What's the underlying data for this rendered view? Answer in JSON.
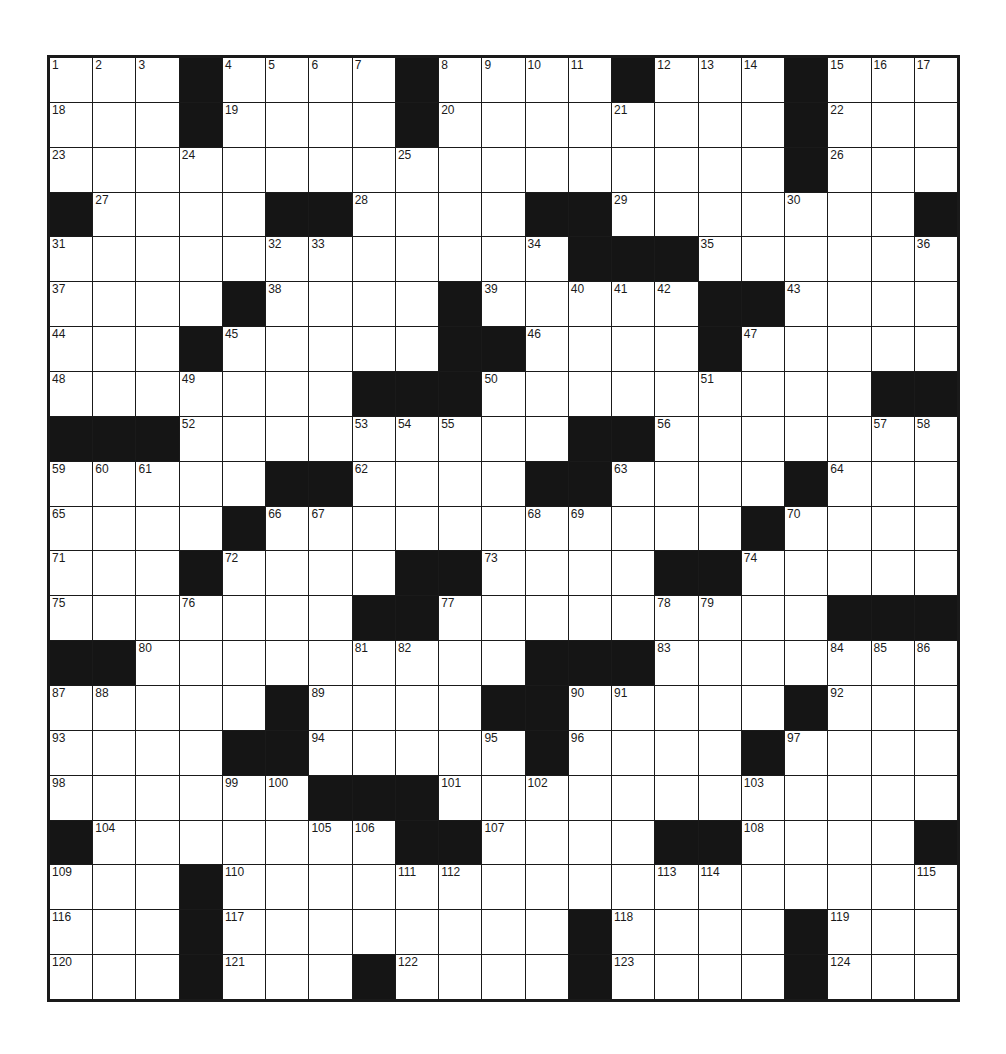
{
  "puzzle": {
    "rows": 21,
    "cols": 21,
    "colors": {
      "block": "#151515",
      "cell": "#ffffff",
      "line": "#1a1a1a"
    },
    "layout": [
      "...#....#....#...#...",
      "...#....#........#...",
      ".................#...",
      "#....##....##.......#",
      "............###......",
      "....#....#.....##....",
      "...#.....##....#.....",
      ".......###.........##",
      "###.........##.......",
      ".....##....##....#...",
      "....#...........#....",
      "...#....##....##.....",
      ".......##.........###",
      "##.........###.......",
      ".....#....##.....#...",
      "....##.....#....#....",
      "......###............",
      "#.......##....##....#",
      "...#.................",
      "...#........#....#...",
      "...#...#....#....#..."
    ],
    "numbers": [
      [
        1,
        2,
        3,
        null,
        4,
        5,
        6,
        7,
        null,
        8,
        9,
        10,
        11,
        null,
        12,
        13,
        14,
        null,
        15,
        16,
        17
      ],
      [
        18,
        null,
        null,
        null,
        19,
        null,
        null,
        null,
        null,
        20,
        null,
        null,
        null,
        21,
        null,
        null,
        null,
        null,
        22,
        null,
        null
      ],
      [
        23,
        null,
        null,
        24,
        null,
        null,
        null,
        null,
        25,
        null,
        null,
        null,
        null,
        null,
        null,
        null,
        null,
        null,
        26,
        null,
        null
      ],
      [
        null,
        27,
        null,
        null,
        null,
        null,
        null,
        28,
        null,
        null,
        null,
        null,
        null,
        29,
        null,
        null,
        null,
        30,
        null,
        null,
        null
      ],
      [
        31,
        null,
        null,
        null,
        null,
        32,
        33,
        null,
        null,
        null,
        null,
        34,
        null,
        null,
        null,
        35,
        null,
        null,
        null,
        null,
        36
      ],
      [
        37,
        null,
        null,
        null,
        null,
        38,
        null,
        null,
        null,
        null,
        39,
        null,
        40,
        41,
        42,
        null,
        null,
        43,
        null,
        null,
        null
      ],
      [
        44,
        null,
        null,
        null,
        45,
        null,
        null,
        null,
        null,
        null,
        null,
        46,
        null,
        null,
        null,
        null,
        47,
        null,
        null,
        null,
        null
      ],
      [
        48,
        null,
        null,
        49,
        null,
        null,
        null,
        null,
        null,
        null,
        50,
        null,
        null,
        null,
        null,
        51,
        null,
        null,
        null,
        null,
        null
      ],
      [
        null,
        null,
        null,
        52,
        null,
        null,
        null,
        53,
        54,
        55,
        null,
        null,
        null,
        null,
        56,
        null,
        null,
        null,
        null,
        57,
        58
      ],
      [
        59,
        60,
        61,
        null,
        null,
        null,
        null,
        62,
        null,
        null,
        null,
        null,
        null,
        63,
        null,
        null,
        null,
        null,
        64,
        null,
        null
      ],
      [
        65,
        null,
        null,
        null,
        null,
        66,
        67,
        null,
        null,
        null,
        null,
        68,
        69,
        null,
        null,
        null,
        null,
        70,
        null,
        null,
        null
      ],
      [
        71,
        null,
        null,
        null,
        72,
        null,
        null,
        null,
        null,
        null,
        73,
        null,
        null,
        null,
        null,
        null,
        74,
        null,
        null,
        null,
        null
      ],
      [
        75,
        null,
        null,
        76,
        null,
        null,
        null,
        null,
        null,
        77,
        null,
        null,
        null,
        null,
        78,
        79,
        null,
        null,
        null,
        null,
        null
      ],
      [
        null,
        null,
        80,
        null,
        null,
        null,
        null,
        81,
        82,
        null,
        null,
        null,
        null,
        null,
        83,
        null,
        null,
        null,
        84,
        85,
        86
      ],
      [
        87,
        88,
        null,
        null,
        null,
        null,
        89,
        null,
        null,
        null,
        null,
        null,
        90,
        91,
        null,
        null,
        null,
        null,
        92,
        null,
        null
      ],
      [
        93,
        null,
        null,
        null,
        null,
        null,
        94,
        null,
        null,
        null,
        95,
        null,
        96,
        null,
        null,
        null,
        null,
        97,
        null,
        null,
        null
      ],
      [
        98,
        null,
        null,
        null,
        99,
        100,
        null,
        null,
        null,
        101,
        null,
        102,
        null,
        null,
        null,
        null,
        103,
        null,
        null,
        null,
        null
      ],
      [
        null,
        104,
        null,
        null,
        null,
        null,
        105,
        106,
        null,
        null,
        107,
        null,
        null,
        null,
        null,
        null,
        108,
        null,
        null,
        null,
        null
      ],
      [
        109,
        null,
        null,
        null,
        110,
        null,
        null,
        null,
        111,
        112,
        null,
        null,
        null,
        null,
        113,
        114,
        null,
        null,
        null,
        null,
        115
      ],
      [
        116,
        null,
        null,
        null,
        117,
        null,
        null,
        null,
        null,
        null,
        null,
        null,
        null,
        118,
        null,
        null,
        null,
        null,
        119,
        null,
        null
      ],
      [
        120,
        null,
        null,
        null,
        121,
        null,
        null,
        null,
        122,
        null,
        null,
        null,
        null,
        123,
        null,
        null,
        null,
        null,
        124,
        null,
        null
      ]
    ]
  }
}
